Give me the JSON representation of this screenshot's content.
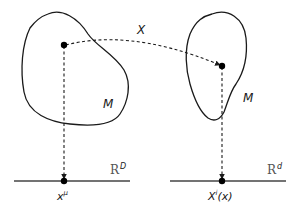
{
  "diagram": {
    "type": "manifold-coordinate-map",
    "colors": {
      "stroke": "#1a1a1a",
      "axis": "#444444",
      "space_label": "#555555",
      "background": "#ffffff"
    },
    "left": {
      "manifold_label": "M",
      "space_label_base": "R",
      "space_label_sup": "D",
      "point_label_base": "x",
      "point_label_sup": "μ"
    },
    "right": {
      "manifold_label": "M",
      "space_label_base": "R",
      "space_label_sup": "d",
      "point_label_base": "X",
      "point_label_sup": "i",
      "point_label_arg": "(x)"
    },
    "map_label": "X"
  }
}
